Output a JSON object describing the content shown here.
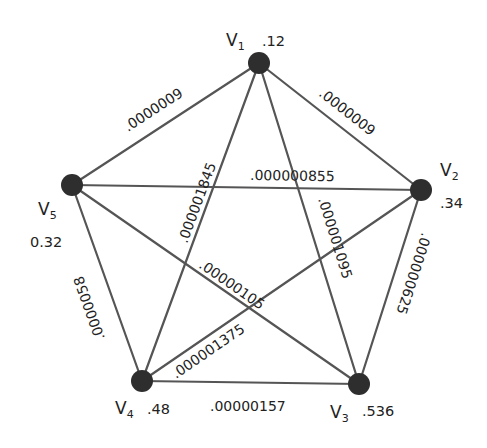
{
  "diagram": {
    "type": "complete-graph-pentagon",
    "nodes": [
      {
        "id": "V1",
        "label_base": "V",
        "label_sub": "1",
        "weight": ".12",
        "x": 259,
        "y": 63
      },
      {
        "id": "V2",
        "label_base": "V",
        "label_sub": "2",
        "weight": ".34",
        "x": 421,
        "y": 190
      },
      {
        "id": "V3",
        "label_base": "V",
        "label_sub": "3",
        "weight": ".536",
        "x": 359,
        "y": 384
      },
      {
        "id": "V4",
        "label_base": "V",
        "label_sub": "4",
        "weight": ".48",
        "x": 142,
        "y": 381
      },
      {
        "id": "V5",
        "label_base": "V",
        "label_sub": "5",
        "weight": "0.32",
        "x": 72,
        "y": 185
      }
    ],
    "edges": [
      {
        "from": "V1",
        "to": "V5",
        "label": ".0000009"
      },
      {
        "from": "V1",
        "to": "V2",
        "label": ".0000009"
      },
      {
        "from": "V1",
        "to": "V4",
        "label": ".000001845"
      },
      {
        "from": "V1",
        "to": "V3",
        "label": ".000001095"
      },
      {
        "from": "V5",
        "to": "V2",
        "label": ".000000855"
      },
      {
        "from": "V2",
        "to": "V3",
        "label": ".000000625"
      },
      {
        "from": "V5",
        "to": "V4",
        "label": ".0000058"
      },
      {
        "from": "V5",
        "to": "V3",
        "label": ".00000105"
      },
      {
        "from": "V2",
        "to": "V4",
        "label": ".000001375"
      },
      {
        "from": "V4",
        "to": "V3",
        "label": ".00000157"
      }
    ]
  }
}
